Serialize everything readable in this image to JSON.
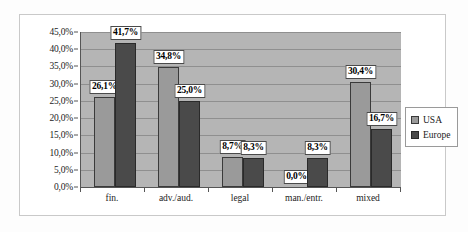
{
  "chart_data": {
    "type": "bar",
    "title": "",
    "subtitle": "",
    "xlabel": "",
    "ylabel": "",
    "categories": [
      "fin.",
      "adv./aud.",
      "legal",
      "man./entr.",
      "mixed"
    ],
    "series": [
      {
        "name": "USA",
        "color": "#9a9a9a",
        "values": [
          26.1,
          34.8,
          8.7,
          0.0,
          30.4
        ],
        "labels": [
          "26,1%",
          "34,8%",
          "8,7%",
          "0,0%",
          "30,4%"
        ]
      },
      {
        "name": "Europe",
        "color": "#4a4a4a",
        "values": [
          41.7,
          25.0,
          8.3,
          8.3,
          16.7
        ],
        "labels": [
          "41,7%",
          "25,0%",
          "8,3%",
          "8,3%",
          "16,7%"
        ]
      }
    ],
    "ylim": [
      0,
      45
    ],
    "ytick_values": [
      0,
      5,
      10,
      15,
      20,
      25,
      30,
      35,
      40,
      45
    ],
    "ytick_labels": [
      "0,0%",
      "5,0%",
      "10,0%",
      "15,0%",
      "20,0%",
      "25,0%",
      "30,0%",
      "35,0%",
      "40,0%",
      "45,0%"
    ],
    "grid": true,
    "grid_axis": "y",
    "legend_position": "right",
    "plot_background": "#b5b5b5",
    "figure_background": "#ffffff",
    "decimal_separator": ","
  },
  "legend": {
    "items": [
      {
        "label": "USA",
        "color": "#9a9a9a"
      },
      {
        "label": "Europe",
        "color": "#4a4a4a"
      }
    ]
  }
}
